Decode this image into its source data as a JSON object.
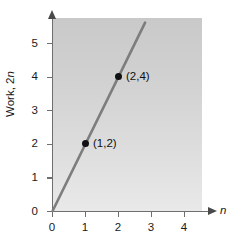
{
  "chart_data": {
    "type": "line",
    "title": "",
    "subtitle": "",
    "xlabel": "n",
    "ylabel": "Work, 2n",
    "xlim": [
      0,
      4.7
    ],
    "ylim": [
      0,
      5.75
    ],
    "grid": false,
    "legend": null,
    "x_ticks": [
      "0",
      "1",
      "2",
      "3",
      "4"
    ],
    "x_tick_values": [
      0,
      1,
      2,
      3,
      4
    ],
    "y_ticks": [
      "0",
      "1",
      "2",
      "3",
      "4",
      "5"
    ],
    "y_tick_values": [
      0,
      1,
      2,
      3,
      4,
      5
    ],
    "series": [
      {
        "name": "Work = 2n",
        "x": [
          0,
          2.8
        ],
        "values": [
          0,
          5.6
        ],
        "color": "#7d7d7d",
        "style": "solid"
      }
    ],
    "points": [
      {
        "x": 1,
        "y": 2,
        "label": "(1,2)"
      },
      {
        "x": 2,
        "y": 4,
        "label": "(2,4)"
      }
    ],
    "origin_label_y": "0",
    "origin_label_x": "0",
    "colors": {
      "plot_background_top": "#c9c9c9",
      "plot_background_bottom": "#e9e9e9",
      "axis": "#6f6f6f",
      "line": "#7d7d7d",
      "point": "#111111",
      "text": "#1a1a1a"
    }
  },
  "axes": {
    "y_title_prefix": "Work, 2",
    "y_title_italic": "n",
    "x_title": "n"
  }
}
